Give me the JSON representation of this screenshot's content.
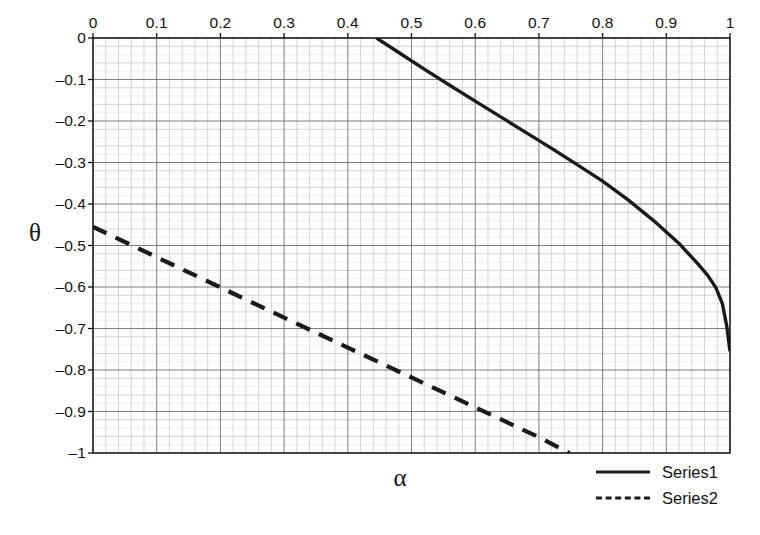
{
  "chart_data": {
    "type": "line",
    "title": "",
    "xlabel": "α",
    "ylabel": "θ",
    "xlim": [
      0,
      1
    ],
    "ylim": [
      -1,
      0
    ],
    "x_axis_position": "top",
    "grid": true,
    "grid_minor": true,
    "x_ticks": [
      0,
      0.1,
      0.2,
      0.3,
      0.4,
      0.5,
      0.6,
      0.7,
      0.8,
      0.9,
      1
    ],
    "x_tick_labels": [
      "0",
      "0.1",
      "0.2",
      "0.3",
      "0.4",
      "0.5",
      "0.6",
      "0.7",
      "0.8",
      "0.9",
      "1"
    ],
    "y_ticks": [
      0,
      -0.1,
      -0.2,
      -0.3,
      -0.4,
      -0.5,
      -0.6,
      -0.7,
      -0.8,
      -0.9,
      -1
    ],
    "y_tick_labels": [
      "0",
      "–0.1",
      "–0.2",
      "–0.3",
      "–0.4",
      "–0.5",
      "–0.6",
      "–0.7",
      "–0.8",
      "–0.9",
      "–1"
    ],
    "legend_position": "bottom-right",
    "series": [
      {
        "name": "Series1",
        "style": "solid",
        "color": "#1a1a1a",
        "x": [
          0.445,
          0.48,
          0.52,
          0.56,
          0.6,
          0.64,
          0.68,
          0.72,
          0.76,
          0.8,
          0.84,
          0.88,
          0.92,
          0.95,
          0.965,
          0.978,
          0.988,
          0.995,
          1.0
        ],
        "y": [
          0.0,
          -0.035,
          -0.075,
          -0.114,
          -0.152,
          -0.19,
          -0.228,
          -0.266,
          -0.305,
          -0.345,
          -0.39,
          -0.44,
          -0.495,
          -0.545,
          -0.572,
          -0.602,
          -0.64,
          -0.695,
          -0.755
        ]
      },
      {
        "name": "Series2",
        "style": "dashed",
        "color": "#1a1a1a",
        "x": [
          0.0,
          0.1,
          0.2,
          0.3,
          0.4,
          0.5,
          0.6,
          0.7,
          0.748
        ],
        "y": [
          -0.455,
          -0.528,
          -0.601,
          -0.674,
          -0.746,
          -0.818,
          -0.89,
          -0.962,
          -1.0
        ]
      }
    ]
  },
  "legend": {
    "items": [
      {
        "label": "Series1",
        "style": "solid"
      },
      {
        "label": "Series2",
        "style": "dashed"
      }
    ]
  }
}
